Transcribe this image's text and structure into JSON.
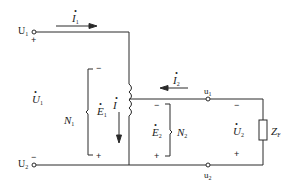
{
  "diagram": {
    "type": "autotransformer-circuit",
    "colors": {
      "line": "#2a2a2a",
      "background": "#ffffff"
    },
    "terminals": {
      "U1": {
        "label": "U",
        "sub": "1",
        "polarity": "+"
      },
      "U2": {
        "label": "U",
        "sub": "2",
        "polarity": "−"
      },
      "u1": {
        "label": "u",
        "sub": "1"
      },
      "u2": {
        "label": "u",
        "sub": "2"
      }
    },
    "currents": {
      "I1": {
        "label": "I",
        "sub": "1",
        "direction": "right"
      },
      "I2": {
        "label": "I",
        "sub": "2",
        "direction": "left"
      },
      "I": {
        "label": "I",
        "sub": "",
        "direction": "down"
      }
    },
    "voltages": {
      "U1": {
        "label": "U",
        "sub": "1"
      },
      "E1": {
        "label": "E",
        "sub": "1",
        "top_sign": "−",
        "bottom_sign": "+"
      },
      "E2": {
        "label": "E",
        "sub": "2",
        "top_sign": "−",
        "bottom_sign": "+"
      },
      "U2": {
        "label": "U",
        "sub": "2",
        "top_sign": "−",
        "bottom_sign": "+"
      }
    },
    "windings": {
      "N1": {
        "label": "N",
        "sub": "1"
      },
      "N2": {
        "label": "N",
        "sub": "2"
      }
    },
    "load": {
      "label": "Z",
      "sub": "F"
    }
  }
}
